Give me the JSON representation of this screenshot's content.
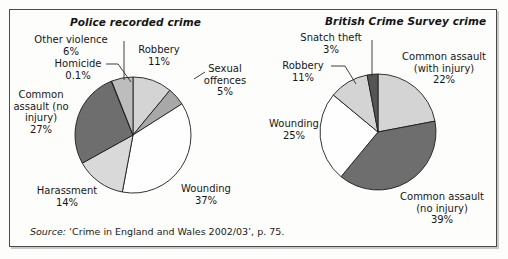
{
  "figure": {
    "source_prefix": "Source:",
    "source_text": "‘Crime in England and Wales 2002/03’, p. 75.",
    "border_color": "#4a4a4a",
    "background": "#fdfdfc"
  },
  "chart_data": [
    {
      "type": "pie",
      "id": "police-recorded-crime",
      "title": "Police recorded crime",
      "categories": [
        "Robbery",
        "Sexual offences",
        "Wounding",
        "Harassment",
        "Common assault (no injury)",
        "Homicide",
        "Other violence"
      ],
      "values": [
        11,
        5,
        37,
        14,
        27,
        0.1,
        6
      ],
      "value_labels": [
        "11%",
        "5%",
        "37%",
        "14%",
        "27%",
        "0.1%",
        "6%"
      ],
      "slice_colors": [
        "#d4d4d4",
        "#a8a8a8",
        "#fefefe",
        "#d9d9d9",
        "#6e6e6e",
        "#3a3a3a",
        "#bdbdbd"
      ],
      "start_angle_deg": 0,
      "legend": "none",
      "labels": [
        {
          "name": "other-violence",
          "lines": [
            "Other violence",
            "6%"
          ]
        },
        {
          "name": "homicide",
          "lines": [
            "Homicide",
            "0.1%"
          ]
        },
        {
          "name": "common-assault-no-injury",
          "lines": [
            "Common",
            "assault (no",
            "injury)",
            "27%"
          ]
        },
        {
          "name": "harassment",
          "lines": [
            "Harassment",
            "14%"
          ]
        },
        {
          "name": "wounding",
          "lines": [
            "Wounding",
            "37%"
          ]
        },
        {
          "name": "sexual-offences",
          "lines": [
            "Sexual",
            "offences",
            "5%"
          ]
        },
        {
          "name": "robbery",
          "lines": [
            "Robbery",
            "11%"
          ]
        }
      ]
    },
    {
      "type": "pie",
      "id": "british-crime-survey-crime",
      "title": "British Crime Survey crime",
      "categories": [
        "Common assault (with injury)",
        "Common assault (no injury)",
        "Wounding",
        "Robbery",
        "Snatch theft"
      ],
      "values": [
        22,
        39,
        25,
        11,
        3
      ],
      "value_labels": [
        "22%",
        "39%",
        "25%",
        "11%",
        "3%"
      ],
      "slice_colors": [
        "#d4d4d4",
        "#6e6e6e",
        "#fefefe",
        "#d4d4d4",
        "#555555"
      ],
      "start_angle_deg": 0,
      "legend": "none",
      "labels": [
        {
          "name": "snatch-theft",
          "lines": [
            "Snatch theft",
            "3%"
          ]
        },
        {
          "name": "robbery",
          "lines": [
            "Robbery",
            "11%"
          ]
        },
        {
          "name": "wounding",
          "lines": [
            "Wounding",
            "25%"
          ]
        },
        {
          "name": "common-assault-with-injury",
          "lines": [
            "Common assault",
            "(with injury)",
            "22%"
          ]
        },
        {
          "name": "common-assault-no-injury",
          "lines": [
            "Common assault",
            "(no injury)",
            "39%"
          ]
        }
      ]
    }
  ]
}
